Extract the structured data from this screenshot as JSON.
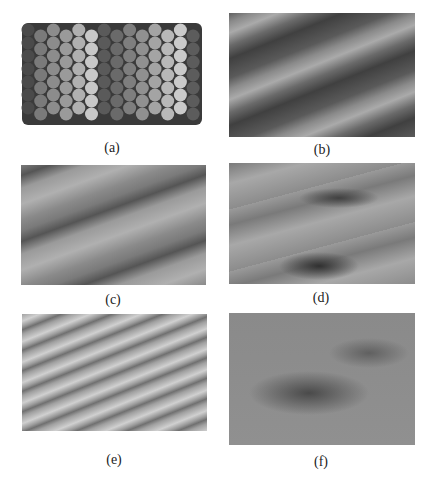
{
  "figure": {
    "panels": [
      {
        "id": "a",
        "caption": "(a)",
        "type": "schematic",
        "description": "ball model of stepped crystal surface with atomic rows shaded by terrace height"
      },
      {
        "id": "b",
        "caption": "(b)",
        "type": "micrograph",
        "description": "smooth diagonal terraces"
      },
      {
        "id": "c",
        "caption": "(c)",
        "type": "micrograph",
        "description": "diagonal steps with small defect"
      },
      {
        "id": "d",
        "caption": "(d)",
        "type": "micrograph",
        "description": "rough steps with islands"
      },
      {
        "id": "e",
        "caption": "(e)",
        "type": "micrograph",
        "description": "dense narrow diagonal terraces"
      },
      {
        "id": "f",
        "caption": "(f)",
        "type": "micrograph",
        "description": "blurred surface with dark diagonal band"
      }
    ]
  },
  "colors": {
    "background": "#ffffff",
    "caption": "#222222"
  }
}
